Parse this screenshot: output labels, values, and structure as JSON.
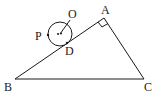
{
  "diagram": {
    "type": "geometry",
    "colors": {
      "stroke": "#1a1a1a",
      "background": "#ffffff"
    },
    "labels": {
      "A": "A",
      "B": "B",
      "C": "C",
      "D": "D",
      "O": "O",
      "P": "P"
    },
    "right_angle_at": "A"
  }
}
